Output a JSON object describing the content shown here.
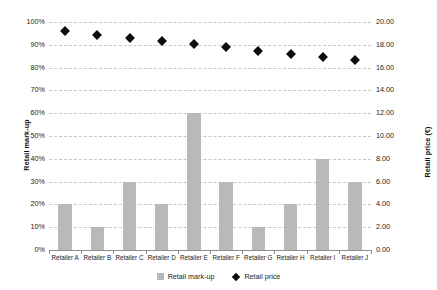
{
  "chart_data": {
    "type": "bar",
    "title": "",
    "xlabel": "",
    "ylabel": "Retail mark-up",
    "y2label": "Retail price (€)",
    "grid": true,
    "legend_position": "bottom",
    "categories": [
      "Retailer A",
      "Retailer B",
      "Retailer C",
      "Retailer D",
      "Retailer E",
      "Retailer F",
      "Retailer G",
      "Retailer H",
      "Retailer I",
      "Retailer J"
    ],
    "ylim": [
      0,
      100
    ],
    "ytick_labels": [
      "0%",
      "10%",
      "20%",
      "30%",
      "40%",
      "50%",
      "60%",
      "70%",
      "80%",
      "90%",
      "100%"
    ],
    "ytick_values": [
      0,
      10,
      20,
      30,
      40,
      50,
      60,
      70,
      80,
      90,
      100
    ],
    "y2lim": [
      0,
      20
    ],
    "y2tick_labels": [
      "0.00",
      "2.00",
      "4.00",
      "6.00",
      "8.00",
      "10.00",
      "12.00",
      "14.00",
      "16.00",
      "18.00",
      "20.00"
    ],
    "y2tick_values": [
      0,
      2,
      4,
      6,
      8,
      10,
      12,
      14,
      16,
      18,
      20
    ],
    "series": [
      {
        "name": "Retail mark-up",
        "type": "bar",
        "axis": "left",
        "unit": "%",
        "color": "#b9b9b9",
        "values": [
          20,
          10,
          30,
          20,
          60,
          30,
          10,
          20,
          40,
          30
        ]
      },
      {
        "name": "Retail price",
        "type": "scatter",
        "axis": "right",
        "unit": "€",
        "color": "#0d0d0d",
        "marker": "diamond",
        "values": [
          19.2,
          18.9,
          18.6,
          18.3,
          18.1,
          17.8,
          17.5,
          17.2,
          16.9,
          16.7
        ]
      }
    ]
  },
  "legend": {
    "items": [
      {
        "label": "Retail mark-up",
        "icon": "square-swatch-icon"
      },
      {
        "label": "Retail price",
        "icon": "diamond-marker-icon"
      }
    ]
  }
}
